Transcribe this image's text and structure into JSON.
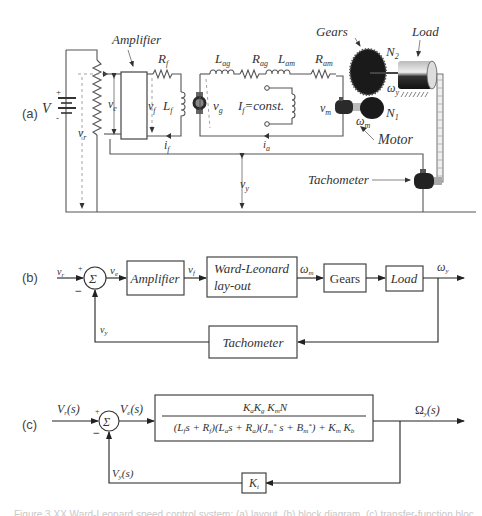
{
  "panels": {
    "a": {
      "tag": "(a)",
      "labels": {
        "source_voltage": "V",
        "plus": "+",
        "minus": "-",
        "amplifier": "Amplifier",
        "v_r": "v",
        "v_r_sub": "r",
        "v_e": "v",
        "v_e_sub": "e",
        "v_f": "v",
        "v_f_sub": "f",
        "R_f": "R",
        "R_f_sub": "f",
        "L_f": "L",
        "L_f_sub": "f",
        "i_f": "i",
        "i_f_sub": "f",
        "L_ag": "L",
        "L_ag_sub": "ag",
        "R_ag": "R",
        "R_ag_sub": "ag",
        "L_am": "L",
        "L_am_sub": "am",
        "R_am": "R",
        "R_am_sub": "am",
        "v_g": "v",
        "v_g_sub": "g",
        "I_f_const": "I",
        "I_f_const_sub": "f",
        "I_f_const_rest": "=const.",
        "i_a": "i",
        "i_a_sub": "a",
        "v_m": "v",
        "v_m_sub": "m",
        "gears": "Gears",
        "load": "Load",
        "N2": "N",
        "N2_sub": "2",
        "N1": "N",
        "N1_sub": "1",
        "omega_y": "ω",
        "omega_y_sub": "y",
        "omega_m": "ω",
        "omega_m_sub": "m",
        "motor": "Motor",
        "tachometer": "Tachometer",
        "v_y": "v",
        "v_y_sub": "y"
      }
    },
    "b": {
      "tag": "(b)",
      "input": "v",
      "input_sub": "r",
      "plus": "+",
      "minus": "−",
      "sum": "Σ",
      "error": "v",
      "error_sub": "e",
      "blocks": {
        "amplifier": "Amplifier",
        "ward_leonard_line1": "Ward-Leonard",
        "ward_leonard_line2": "lay-out",
        "gears": "Gears",
        "load": "Load",
        "tachometer": "Tachometer"
      },
      "signals": {
        "v_f": "v",
        "v_f_sub": "f",
        "omega_m": "ω",
        "omega_m_sub": "m",
        "omega_y": "ω",
        "omega_y_sub": "y",
        "v_y": "v",
        "v_y_sub": "y"
      }
    },
    "c": {
      "tag": "(c)",
      "input": "V",
      "input_sub": "r",
      "input_arg": "(s)",
      "plus": "+",
      "minus": "−",
      "sum": "Σ",
      "error": "V",
      "error_sub": "e",
      "error_arg": "(s)",
      "transfer_numerator": "KₐK_gK_mN",
      "transfer_denominator": "(L_f s + R_f)(Lₐs + Rₐ)(J*_m s + B*_m) + K_m K_b",
      "output": "Ω",
      "output_sub": "y",
      "output_arg": "(s)",
      "feedback_gain": "K",
      "feedback_gain_sub": "t",
      "feedback_signal": "V",
      "feedback_signal_sub": "y",
      "feedback_signal_arg": "(s)"
    }
  },
  "caption": "Figure 3.XX  Ward-Leonard speed control system: (a) layout, (b) block diagram, (c) transfer-function block diagram"
}
